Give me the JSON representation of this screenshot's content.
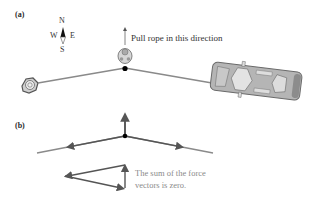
{
  "panel_a": {
    "label": "(a)",
    "compass": {
      "n": "N",
      "s": "S",
      "w": "W",
      "e": "E"
    },
    "pull_text": "Pull rope in this direction"
  },
  "panel_b": {
    "label": "(b)",
    "note_line1": "The sum of the force",
    "note_line2": "vectors is zero."
  },
  "colors": {
    "rope": "#8a8a8a",
    "vector": "#555555",
    "car_body": "#b5b5b5",
    "car_outline": "#6a6a6a",
    "note_text": "#8a8a8a"
  }
}
